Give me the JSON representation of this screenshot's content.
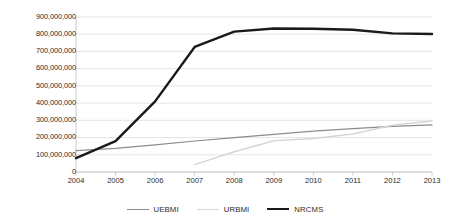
{
  "chart_data": {
    "type": "line",
    "title": "",
    "subtitle": "",
    "xlabel": "",
    "ylabel": "",
    "grid": true,
    "legend_position": "bottom",
    "categories": [
      2004,
      2005,
      2006,
      2007,
      2008,
      2009,
      2010,
      2011,
      2012,
      2013
    ],
    "x": [
      2004,
      2005,
      2006,
      2007,
      2008,
      2009,
      2010,
      2011,
      2012,
      2013
    ],
    "xlim": [
      2004,
      2013
    ],
    "ylim": [
      0,
      900000000
    ],
    "ytick_step": 100000000,
    "ytick_labels": [
      "0",
      "100,000,000",
      "200,000,000",
      "300,000,000",
      "400,000,000",
      "500,000,000",
      "600,000,000",
      "700,000,000",
      "800,000,000",
      "900,000,000"
    ],
    "ytick_values": [
      0,
      100000000,
      200000000,
      300000000,
      400000000,
      500000000,
      600000000,
      700000000,
      800000000,
      900000000
    ],
    "xtick_labels": [
      "2004",
      "2005",
      "2006",
      "2007",
      "2008",
      "2009",
      "2010",
      "2011",
      "2012",
      "2013"
    ],
    "series": [
      {
        "name": "UEBMI",
        "color": "#8c8c8c",
        "width": 1.2,
        "values": [
          124000000,
          137000000,
          157000000,
          180000000,
          200000000,
          219000000,
          237000000,
          252000000,
          265000000,
          274000000
        ]
      },
      {
        "name": "URBMI",
        "color": "#d6d6d6",
        "width": 1.5,
        "values": [
          null,
          null,
          null,
          43000000,
          118000000,
          182000000,
          195000000,
          221000000,
          271000000,
          296000000
        ]
      },
      {
        "name": "NRCMS",
        "color": "#1a1a1a",
        "width": 2.4,
        "values": [
          80000000,
          179000000,
          410000000,
          726000000,
          815000000,
          833000000,
          832000000,
          826000000,
          805000000,
          801000000
        ]
      }
    ]
  },
  "legend": {
    "items": [
      {
        "label": "UEBMI",
        "color": "#8c8c8c",
        "width": 1.4
      },
      {
        "label": "URBMI",
        "color": "#d9d9d9",
        "width": 1.6
      },
      {
        "label": "NRCMS",
        "color": "#1a1a1a",
        "width": 2.6
      }
    ]
  },
  "colors": {
    "background": "#ffffff",
    "gridline": "#d9d9e3",
    "axis": "#bfbfbf",
    "text": "#2b2b2b",
    "uebmi": "#8c8c8c",
    "urbmi": "#d6d6d6",
    "nrcms": "#1a1a1a"
  }
}
